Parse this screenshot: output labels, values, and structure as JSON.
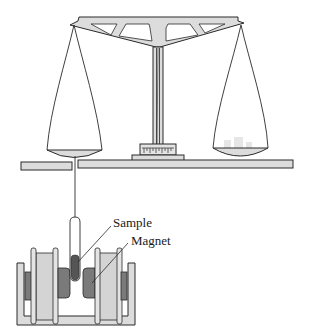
{
  "figure": {
    "type": "schematic",
    "labels": {
      "sample": "Sample",
      "magnet": "Magnet"
    },
    "components": [
      "balance-beam",
      "balance-column",
      "scale-indicator",
      "left-pan",
      "right-pan-with-weights",
      "platform",
      "suspension-wire",
      "sample-tube",
      "electromagnet-pair",
      "magnet-frame"
    ]
  },
  "colors": {
    "stroke": "#2a2a2a",
    "fill_light": "#dcdcdc",
    "fill_mid": "#c8c8c8",
    "fill_dark": "#7a7a7a",
    "sample_fill": "#555555",
    "background": "#ffffff"
  }
}
